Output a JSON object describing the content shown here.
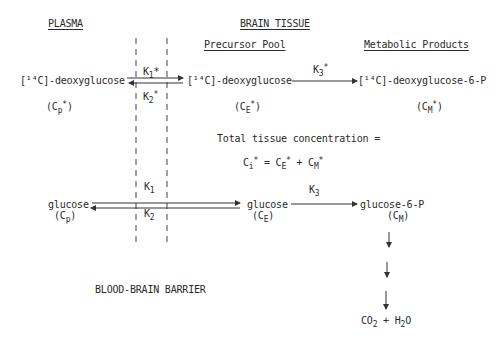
{
  "headings": {
    "plasma": "PLASMA",
    "brain_tissue": "BRAIN TISSUE",
    "precursor_pool": "Precursor Pool",
    "metabolic_products": "Metabolic Products"
  },
  "tracer_row": {
    "plasma_compound": "[¹⁴C]-deoxyglucose",
    "plasma_symbol": {
      "base": "(C",
      "sub": "p",
      "sup": "*",
      "close": ")"
    },
    "precursor_compound": "[¹⁴C]-deoxyglucose",
    "precursor_symbol": {
      "base": "(C",
      "sub": "E",
      "sup": "*",
      "close": ")"
    },
    "product_compound": "[¹⁴C]-deoxyglucose-6-P",
    "product_symbol": {
      "base": "(C",
      "sub": "M",
      "sup": "*",
      "close": ")"
    },
    "k1": {
      "base": "K",
      "sub": "1",
      "suffix": "*"
    },
    "k2": {
      "base": "K",
      "sub": "2",
      "suffix": "*"
    },
    "k3": {
      "base": "K",
      "sub": "3",
      "suffix": "*"
    }
  },
  "total_concentration": {
    "label": "Total tissue concentration =",
    "equation": {
      "lhs_base": "C",
      "lhs_sub": "i",
      "star": "*",
      "eq": " = ",
      "t1_base": "C",
      "t1_sub": "E",
      "plus": " + ",
      "t2_base": "C",
      "t2_sub": "M"
    }
  },
  "glucose_row": {
    "plasma_compound": "glucose",
    "plasma_symbol": {
      "base": "(C",
      "sub": "p",
      "close": ")"
    },
    "precursor_compound": "glucose",
    "precursor_symbol": {
      "base": "(C",
      "sub": "E",
      "close": ")"
    },
    "product_compound": "glucose-6-P",
    "product_symbol": {
      "base": "(C",
      "sub": "M",
      "close": ")"
    },
    "k1": {
      "base": "K",
      "sub": "1"
    },
    "k2": {
      "base": "K",
      "sub": "2"
    },
    "k3": {
      "base": "K",
      "sub": "3"
    }
  },
  "end_products": {
    "co": "CO",
    "co_sub": "2",
    "plus": " + ",
    "h": "H",
    "h_sub": "2",
    "o": "O"
  },
  "barrier_label": "BLOOD-BRAIN BARRIER"
}
